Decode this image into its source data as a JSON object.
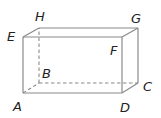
{
  "diagram": {
    "type": "rectangular-prism",
    "colors": {
      "edge": "#8a8a8a",
      "label": "#222222",
      "background": "#ffffff"
    },
    "vertices": {
      "A": {
        "label": "A",
        "x": 23,
        "y": 93,
        "label_x": 13,
        "label_y": 111
      },
      "B": {
        "label": "B",
        "x": 39,
        "y": 83,
        "label_x": 42,
        "label_y": 78
      },
      "C": {
        "label": "C",
        "x": 138,
        "y": 83,
        "label_x": 143,
        "label_y": 91
      },
      "D": {
        "label": "D",
        "x": 122,
        "y": 93,
        "label_x": 120,
        "label_y": 112
      },
      "E": {
        "label": "E",
        "x": 23,
        "y": 37,
        "label_x": 7,
        "label_y": 41
      },
      "F": {
        "label": "F",
        "x": 122,
        "y": 37,
        "label_x": 110,
        "label_y": 55
      },
      "G": {
        "label": "G",
        "x": 138,
        "y": 28,
        "label_x": 131,
        "label_y": 23
      },
      "H": {
        "label": "H",
        "x": 39,
        "y": 28,
        "label_x": 35,
        "label_y": 21
      }
    },
    "visible_edges": [
      "AD",
      "DF",
      "FE",
      "EA",
      "EH",
      "HG",
      "GF",
      "GC",
      "CD"
    ],
    "hidden_edges": [
      "AB",
      "BC",
      "BH"
    ]
  }
}
